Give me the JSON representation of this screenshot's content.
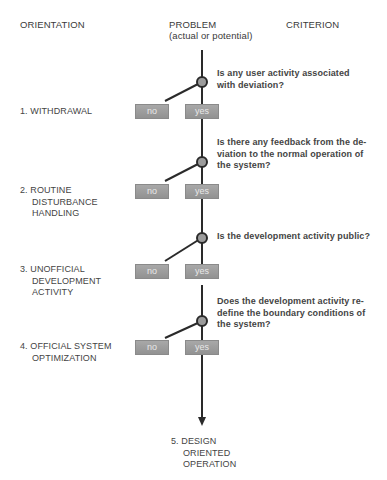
{
  "headers": {
    "orientation": "ORIENTATION",
    "problem": "PROBLEM",
    "problem_sub": "(actual or potential)",
    "criterion": "CRITERION"
  },
  "questions": [
    {
      "lines": [
        "Is any user activity associated",
        "with deviation?"
      ]
    },
    {
      "lines": [
        "Is there any feedback from the de-",
        "viation to the normal operation of",
        "the system?"
      ]
    },
    {
      "lines": [
        "Is the development activity public?"
      ]
    },
    {
      "lines": [
        "Does the development activity re-",
        "define the boundary conditions of",
        "the system?"
      ]
    }
  ],
  "orientations": [
    {
      "lines": [
        "1. WITHDRAWAL"
      ]
    },
    {
      "lines": [
        "2. ROUTINE",
        "DISTURBANCE",
        "HANDLING"
      ]
    },
    {
      "lines": [
        "3. UNOFFICIAL",
        "DEVELOPMENT",
        "ACTIVITY"
      ]
    },
    {
      "lines": [
        "4. OFFICIAL SYSTEM",
        "OPTIMIZATION"
      ]
    }
  ],
  "final": {
    "lines": [
      "5. DESIGN",
      "ORIENTED",
      "OPERATION"
    ]
  },
  "boxes": {
    "no": "no",
    "yes": "yes"
  },
  "colors": {
    "line": "#2a2a2a",
    "box": "#9a9a9a",
    "node_fill": "#9c9c9c"
  }
}
